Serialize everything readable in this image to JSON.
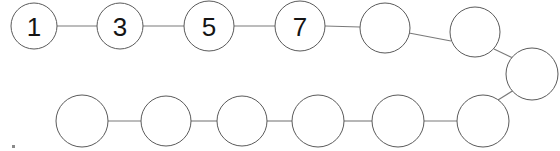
{
  "diagram": {
    "type": "node-chain",
    "canvas": {
      "width": 560,
      "height": 151,
      "background": "#ffffff"
    },
    "style": {
      "circle_fill": "#ffffff",
      "circle_stroke": "#5a5a5a",
      "circle_stroke_width": 1,
      "link_stroke": "#7a7a7a",
      "link_stroke_width": 1.1,
      "label_color": "#141414",
      "label_font_size": 26
    },
    "reading_order": "top row left-to-right, wrap at right edge, bottom row right-to-left",
    "node_count": 14,
    "labeled_count": 4,
    "labels_sequence": [
      "1",
      "3",
      "5",
      "7"
    ],
    "nodes": [
      {
        "id": "n1",
        "label": "1",
        "cx": 34,
        "cy": 26,
        "r": 23,
        "row": "top",
        "labeled": true
      },
      {
        "id": "n2",
        "label": "3",
        "cx": 120,
        "cy": 26,
        "r": 23,
        "row": "top",
        "labeled": true
      },
      {
        "id": "n3",
        "label": "5",
        "cx": 209,
        "cy": 26,
        "r": 25,
        "row": "top",
        "labeled": true
      },
      {
        "id": "n4",
        "label": "7",
        "cx": 300,
        "cy": 26,
        "r": 25,
        "row": "top",
        "labeled": true
      },
      {
        "id": "n5",
        "label": "",
        "cx": 385,
        "cy": 28,
        "r": 25,
        "row": "top",
        "labeled": false
      },
      {
        "id": "n6",
        "label": "",
        "cx": 475,
        "cy": 32,
        "r": 25,
        "row": "top",
        "labeled": false
      },
      {
        "id": "n7",
        "label": "",
        "cx": 532,
        "cy": 74,
        "r": 26,
        "row": "wrap",
        "labeled": false
      },
      {
        "id": "n8",
        "label": "",
        "cx": 483,
        "cy": 121,
        "r": 26,
        "row": "bottom",
        "labeled": false
      },
      {
        "id": "n9",
        "label": "",
        "cx": 398,
        "cy": 121,
        "r": 26,
        "row": "bottom",
        "labeled": false
      },
      {
        "id": "n10",
        "label": "",
        "cx": 318,
        "cy": 121,
        "r": 26,
        "row": "bottom",
        "labeled": false
      },
      {
        "id": "n11",
        "label": "",
        "cx": 242,
        "cy": 121,
        "r": 25,
        "row": "bottom",
        "labeled": false
      },
      {
        "id": "n12",
        "label": "",
        "cx": 166,
        "cy": 121,
        "r": 25,
        "row": "bottom",
        "labeled": false
      },
      {
        "id": "n13",
        "label": "",
        "cx": 82,
        "cy": 121,
        "r": 26,
        "row": "bottom",
        "labeled": false
      }
    ],
    "links": [
      {
        "id": "l1",
        "from": "n1",
        "to": "n2",
        "x1": 57,
        "y1": 26,
        "x2": 97,
        "y2": 26
      },
      {
        "id": "l2",
        "from": "n2",
        "to": "n3",
        "x1": 143,
        "y1": 26,
        "x2": 184,
        "y2": 26
      },
      {
        "id": "l3",
        "from": "n3",
        "to": "n4",
        "x1": 234,
        "y1": 26,
        "x2": 275,
        "y2": 26
      },
      {
        "id": "l4",
        "from": "n4",
        "to": "n5",
        "x1": 325,
        "y1": 26,
        "x2": 360,
        "y2": 27
      },
      {
        "id": "l5",
        "from": "n5",
        "to": "n6",
        "x1": 409,
        "y1": 33,
        "x2": 451,
        "y2": 41
      },
      {
        "id": "l6",
        "from": "n6",
        "to": "n7",
        "x1": 494,
        "y1": 49,
        "x2": 513,
        "y2": 58
      },
      {
        "id": "l7",
        "from": "n7",
        "to": "n8",
        "x1": 514,
        "y1": 90,
        "x2": 498,
        "y2": 100
      },
      {
        "id": "l8",
        "from": "n8",
        "to": "n9",
        "x1": 457,
        "y1": 121,
        "x2": 424,
        "y2": 121
      },
      {
        "id": "l9",
        "from": "n9",
        "to": "n10",
        "x1": 372,
        "y1": 121,
        "x2": 344,
        "y2": 121
      },
      {
        "id": "l10",
        "from": "n10",
        "to": "n11",
        "x1": 292,
        "y1": 121,
        "x2": 267,
        "y2": 121
      },
      {
        "id": "l11",
        "from": "n11",
        "to": "n12",
        "x1": 217,
        "y1": 121,
        "x2": 191,
        "y2": 121
      },
      {
        "id": "l12",
        "from": "n12",
        "to": "n13",
        "x1": 141,
        "y1": 121,
        "x2": 108,
        "y2": 121
      }
    ],
    "artifacts": [
      {
        "id": "a1",
        "name": "speck",
        "x": 12,
        "y": 145,
        "w": 3,
        "h": 3
      }
    ]
  }
}
